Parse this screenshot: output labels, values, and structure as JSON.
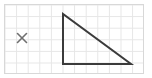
{
  "canvas": {
    "width": 152,
    "height": 78,
    "background_color": "#ffffff",
    "title": "Right triangle on grid paper with cross mark"
  },
  "grid": {
    "name": "grid-paper",
    "line_color": "#e6e6e6",
    "border_color": "#d8d8d8",
    "cell_size": 11.6,
    "origin_x": 4.5,
    "origin_y": 4.5,
    "columns": 12,
    "rows": 6,
    "area_width": 139,
    "area_height": 69,
    "grid_visible": true
  },
  "figure": {
    "name": "right-triangle",
    "type": "polygon",
    "stroke_color": "#3b3b3b",
    "stroke_width": 2,
    "fill": "none",
    "vertices": [
      {
        "label": "apex",
        "x": 63,
        "y": 14
      },
      {
        "label": "right-angle-corner",
        "x": 63,
        "y": 64
      },
      {
        "label": "base-right",
        "x": 131,
        "y": 64
      }
    ],
    "edges": [
      {
        "name": "vertical-leg",
        "from": "apex",
        "to": "right-angle-corner",
        "length_cells": 4.3
      },
      {
        "name": "horizontal-leg",
        "from": "right-angle-corner",
        "to": "base-right",
        "length_cells": 5.9
      },
      {
        "name": "hypotenuse",
        "from": "base-right",
        "to": "apex",
        "length_cells": 7.3
      }
    ]
  },
  "marker": {
    "name": "cross-mark",
    "glyph": "×",
    "label": "x",
    "color": "#6f6f6f",
    "center_x": 22,
    "center_y": 38,
    "size": 9,
    "stroke_width": 1.6
  },
  "chart_data": {
    "type": "scatter",
    "xlabel": "",
    "ylabel": "",
    "xlim": [
      0,
      12
    ],
    "ylim": [
      0,
      6
    ],
    "grid": true,
    "legend": "none",
    "series": [
      {
        "name": "triangle-outline",
        "kind": "polygon",
        "closed": true,
        "x": [
          5.05,
          5.05,
          10.9
        ],
        "y": [
          5.18,
          0.86,
          0.86
        ]
      },
      {
        "name": "cross-marker",
        "kind": "point",
        "x": [
          1.51
        ],
        "y": [
          3.05
        ]
      }
    ],
    "annotations": [
      {
        "text": "×",
        "x": 1.51,
        "y": 3.05
      }
    ]
  }
}
